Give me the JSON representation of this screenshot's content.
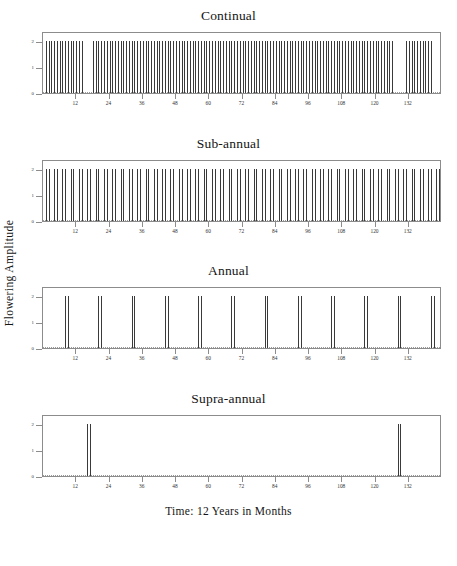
{
  "figure": {
    "ylabel": "Flowering  Amplitude",
    "xlabel": "Time:  12  Years  in  Months"
  },
  "chart_data": {
    "type": "bar",
    "xlabel": "Time: 12 Years in Months",
    "ylabel": "Flowering Amplitude",
    "xlim": [
      0,
      144
    ],
    "ylim": [
      0,
      2.4
    ],
    "xticks": [
      12,
      24,
      36,
      48,
      60,
      72,
      84,
      96,
      108,
      120,
      132
    ],
    "xticklabels": [
      "12",
      "24",
      "36",
      "48",
      "60",
      "72",
      "84",
      "96",
      "108",
      "120",
      "132"
    ],
    "yticks": [
      0,
      1,
      2
    ],
    "yticklabels": [
      "0",
      "1",
      "2"
    ],
    "grid": false,
    "legend": null,
    "baseline": 0,
    "panels": [
      {
        "name": "continual",
        "title": "Continual",
        "description": "Near-continuous flowering: spikes at almost every month with two short gaps",
        "amplitude": 2,
        "x": [
          1,
          2,
          3,
          4,
          5,
          6,
          7,
          8,
          9,
          10,
          11,
          12,
          13,
          14,
          18,
          19,
          20,
          21,
          22,
          23,
          24,
          25,
          26,
          27,
          28,
          29,
          30,
          31,
          32,
          33,
          34,
          35,
          36,
          37,
          38,
          39,
          40,
          41,
          42,
          43,
          44,
          45,
          46,
          47,
          48,
          49,
          50,
          51,
          52,
          53,
          54,
          55,
          56,
          57,
          58,
          59,
          60,
          61,
          62,
          63,
          64,
          65,
          66,
          67,
          68,
          69,
          70,
          71,
          72,
          73,
          74,
          75,
          76,
          77,
          78,
          79,
          80,
          81,
          82,
          83,
          84,
          85,
          86,
          87,
          88,
          89,
          90,
          91,
          92,
          93,
          94,
          95,
          96,
          97,
          98,
          99,
          100,
          101,
          102,
          103,
          104,
          105,
          106,
          107,
          108,
          109,
          110,
          111,
          112,
          113,
          114,
          115,
          116,
          117,
          118,
          119,
          120,
          121,
          122,
          123,
          124,
          125,
          126,
          131,
          132,
          133,
          134,
          135,
          136,
          137,
          138,
          139,
          140,
          141,
          142,
          143,
          144
        ],
        "values": [
          2,
          2,
          2,
          2,
          2,
          2,
          2,
          2,
          2,
          2,
          2,
          2,
          2,
          2,
          2,
          2,
          2,
          2,
          2,
          2,
          2,
          2,
          2,
          2,
          2,
          2,
          2,
          2,
          2,
          2,
          2,
          2,
          2,
          2,
          2,
          2,
          2,
          2,
          2,
          2,
          2,
          2,
          2,
          2,
          2,
          2,
          2,
          2,
          2,
          2,
          2,
          2,
          2,
          2,
          2,
          2,
          2,
          2,
          2,
          2,
          2,
          2,
          2,
          2,
          2,
          2,
          2,
          2,
          2,
          2,
          2,
          2,
          2,
          2,
          2,
          2,
          2,
          2,
          2,
          2,
          2,
          2,
          2,
          2,
          2,
          2,
          2,
          2,
          2,
          2,
          2,
          2,
          2,
          2,
          2,
          2,
          2,
          2,
          2,
          2,
          2,
          2,
          2,
          2,
          2,
          2,
          2,
          2,
          2,
          2,
          2,
          2,
          2,
          2,
          2,
          2,
          2,
          2,
          2,
          2,
          2,
          2,
          2,
          2,
          2,
          2,
          2,
          2,
          2,
          2,
          2,
          2,
          2
        ]
      },
      {
        "name": "sub-annual",
        "title": "Sub-annual",
        "description": "Flowering episodes more than once per year: paired spikes roughly every 3 months",
        "amplitude": 2,
        "x": [
          1,
          2,
          4,
          5,
          7,
          8,
          10,
          11,
          13,
          14,
          16,
          17,
          19,
          20,
          22,
          23,
          25,
          26,
          28,
          29,
          31,
          32,
          34,
          35,
          37,
          38,
          40,
          41,
          43,
          44,
          46,
          47,
          49,
          50,
          52,
          53,
          55,
          56,
          58,
          59,
          61,
          62,
          64,
          65,
          67,
          68,
          70,
          71,
          73,
          74,
          76,
          77,
          79,
          80,
          82,
          83,
          85,
          86,
          88,
          89,
          91,
          92,
          94,
          95,
          97,
          98,
          100,
          101,
          103,
          104,
          106,
          107,
          109,
          110,
          112,
          113,
          115,
          116,
          118,
          119,
          121,
          122,
          124,
          125,
          127,
          128,
          130,
          131,
          133,
          134,
          136,
          137,
          139,
          140,
          142,
          143
        ],
        "values": [
          2,
          2,
          2,
          2,
          2,
          2,
          2,
          2,
          2,
          2,
          2,
          2,
          2,
          2,
          2,
          2,
          2,
          2,
          2,
          2,
          2,
          2,
          2,
          2,
          2,
          2,
          2,
          2,
          2,
          2,
          2,
          2,
          2,
          2,
          2,
          2,
          2,
          2,
          2,
          2,
          2,
          2,
          2,
          2,
          2,
          2,
          2,
          2,
          2,
          2,
          2,
          2,
          2,
          2,
          2,
          2,
          2,
          2,
          2,
          2,
          2,
          2,
          2,
          2,
          2,
          2,
          2,
          2,
          2,
          2,
          2,
          2,
          2,
          2,
          2,
          2,
          2,
          2,
          2,
          2,
          2,
          2,
          2,
          2,
          2,
          2,
          2,
          2,
          2,
          2,
          2,
          2,
          2,
          2,
          2,
          2
        ]
      },
      {
        "name": "annual",
        "title": "Annual",
        "description": "One flowering episode per year: 12 paired spikes at ~12 month intervals",
        "amplitude": 2,
        "x": [
          8,
          9,
          20,
          21,
          32,
          33,
          44,
          45,
          56,
          57,
          68,
          69,
          80,
          81,
          92,
          93,
          104,
          105,
          116,
          117,
          128,
          129,
          140,
          141
        ],
        "values": [
          2,
          2,
          2,
          2,
          2,
          2,
          2,
          2,
          2,
          2,
          2,
          2,
          2,
          2,
          2,
          2,
          2,
          2,
          2,
          2,
          2,
          2,
          2,
          2
        ]
      },
      {
        "name": "supra-annual",
        "title": "Supra-annual",
        "description": "Flowering less than once per year: only two episodes in 12 years",
        "amplitude": 2,
        "x": [
          16,
          17,
          128,
          129
        ],
        "values": [
          2,
          2,
          2,
          2
        ]
      }
    ]
  }
}
